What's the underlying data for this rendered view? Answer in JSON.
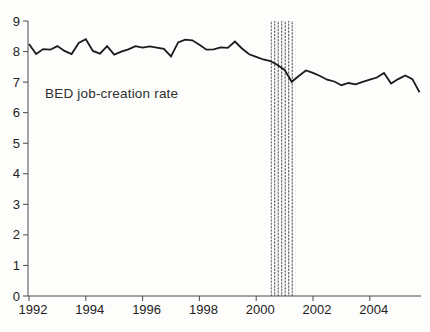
{
  "chart_data": {
    "type": "line",
    "title": "",
    "annotation": "BED job-creation rate",
    "xlabel": "",
    "ylabel": "",
    "ylim": [
      0,
      9
    ],
    "yticks": [
      0,
      1,
      2,
      3,
      4,
      5,
      6,
      7,
      8,
      9
    ],
    "xlim": [
      1992,
      2006
    ],
    "xtick_years": [
      "1992",
      "1994",
      "1996",
      "1998",
      "2000",
      "2002",
      "2004"
    ],
    "grid": false,
    "legend_position": "none",
    "line_color": "#1b1b1b",
    "axis_color": "#4a4a4a",
    "text_color": "#222222",
    "recession_band": {
      "start": 2000.5,
      "end": 2001.37,
      "style": "vertical-dashed-hatch",
      "hatch_color": "#4d4d4d"
    },
    "series": [
      {
        "name": "BED job-creation rate",
        "x": [
          1992.0,
          1992.25,
          1992.5,
          1992.75,
          1993.0,
          1993.25,
          1993.5,
          1993.75,
          1994.0,
          1994.25,
          1994.5,
          1994.75,
          1995.0,
          1995.25,
          1995.5,
          1995.75,
          1996.0,
          1996.25,
          1996.5,
          1996.75,
          1997.0,
          1997.25,
          1997.5,
          1997.75,
          1998.0,
          1998.25,
          1998.5,
          1998.75,
          1999.0,
          1999.25,
          1999.5,
          1999.75,
          2000.0,
          2000.25,
          2000.5,
          2000.75,
          2001.0,
          2001.25,
          2001.5,
          2001.75,
          2002.0,
          2002.25,
          2002.5,
          2002.75,
          2003.0,
          2003.25,
          2003.5,
          2003.75,
          2004.0,
          2004.25,
          2004.5,
          2004.75,
          2005.0,
          2005.25,
          2005.5,
          2005.75
        ],
        "y": [
          8.25,
          7.92,
          8.08,
          8.06,
          8.18,
          8.02,
          7.92,
          8.28,
          8.4,
          8.02,
          7.93,
          8.18,
          7.9,
          8.0,
          8.07,
          8.18,
          8.13,
          8.17,
          8.13,
          8.09,
          7.84,
          8.3,
          8.39,
          8.37,
          8.22,
          8.06,
          8.07,
          8.14,
          8.12,
          8.33,
          8.1,
          7.91,
          7.83,
          7.74,
          7.69,
          7.56,
          7.4,
          7.01,
          7.2,
          7.38,
          7.3,
          7.2,
          7.08,
          7.02,
          6.9,
          6.97,
          6.93,
          7.01,
          7.08,
          7.15,
          7.3,
          6.95,
          7.1,
          7.22,
          7.1,
          6.67
        ]
      }
    ]
  }
}
